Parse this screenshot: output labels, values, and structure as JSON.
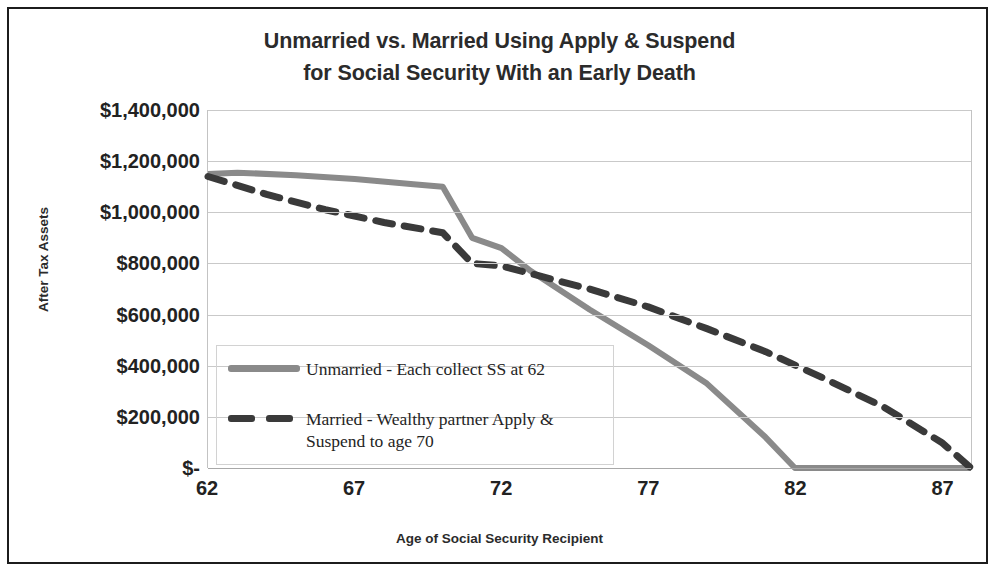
{
  "chart_data": {
    "type": "line",
    "title": "Unmarried vs. Married Using Apply & Suspend for Social Security With an Early Death",
    "title_lines": [
      "Unmarried vs. Married Using Apply & Suspend",
      "for Social Security With an Early Death"
    ],
    "xlabel": "Age of Social Security Recipient",
    "ylabel": "After Tax Assets",
    "xlim": [
      62,
      88
    ],
    "ylim": [
      0,
      1400000
    ],
    "grid": true,
    "legend_position": "inside-lower-left",
    "x_tick_labels": [
      "62",
      "67",
      "72",
      "77",
      "82",
      "87"
    ],
    "x_tick_values": [
      62,
      67,
      72,
      77,
      82,
      87
    ],
    "y_tick_labels": [
      "$1,400,000",
      "$1,200,000",
      "$1,000,000",
      "$800,000",
      "$600,000",
      "$400,000",
      "$200,000",
      "$-"
    ],
    "y_tick_values": [
      1400000,
      1200000,
      1000000,
      800000,
      600000,
      400000,
      200000,
      0
    ],
    "series": [
      {
        "name": "Unmarried - Each collect SS at 62",
        "style": "solid",
        "color": "#8a8a8a",
        "x": [
          62,
          63,
          65,
          67,
          69,
          70,
          71,
          72,
          73,
          75,
          77,
          79,
          81,
          82,
          84,
          86,
          88
        ],
        "values": [
          1150000,
          1155000,
          1145000,
          1130000,
          1110000,
          1100000,
          900000,
          860000,
          770000,
          620000,
          480000,
          330000,
          120000,
          0,
          0,
          0,
          0
        ]
      },
      {
        "name": "Married - Wealthy partner Apply & Suspend to age 70",
        "style": "dashed",
        "color": "#3a3a3a",
        "x": [
          62,
          64,
          66,
          68,
          70,
          71,
          72,
          73,
          75,
          77,
          79,
          81,
          83,
          85,
          87,
          88
        ],
        "values": [
          1140000,
          1070000,
          1010000,
          960000,
          920000,
          800000,
          790000,
          760000,
          700000,
          630000,
          545000,
          455000,
          350000,
          240000,
          100000,
          0
        ]
      }
    ]
  },
  "legend": {
    "entries": [
      {
        "label": "Unmarried - Each collect SS at 62",
        "label_lines": [
          "Unmarried - Each collect SS at 62"
        ]
      },
      {
        "label": "Married - Wealthy partner Apply & Suspend to age 70",
        "label_lines": [
          "Married - Wealthy partner Apply &",
          "Suspend to age 70"
        ]
      }
    ]
  },
  "colors": {
    "series_solid": "#8a8a8a",
    "series_dashed": "#3a3a3a",
    "gridline": "#c9c9c9",
    "text": "#2b2b2b",
    "frame": "#1c1c1c"
  }
}
